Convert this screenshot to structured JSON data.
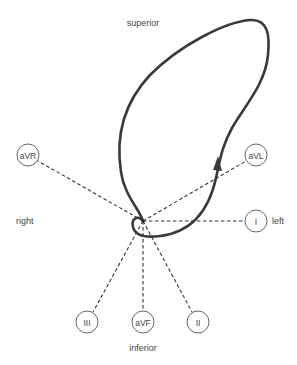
{
  "diagram": {
    "type": "hexaxial vectorcardiogram loop",
    "directions": {
      "superior": "superior",
      "inferior": "inferior",
      "right": "right",
      "left": "left"
    },
    "center": {
      "x": 143,
      "y": 221
    },
    "leads": [
      {
        "id": "aVR",
        "label": "aVR",
        "x": 28,
        "y": 155
      },
      {
        "id": "aVL",
        "label": "aVL",
        "x": 256,
        "y": 155
      },
      {
        "id": "I",
        "label": "I",
        "x": 256,
        "y": 221
      },
      {
        "id": "III",
        "label": "III",
        "x": 87,
        "y": 322
      },
      {
        "id": "aVF",
        "label": "aVF",
        "x": 143,
        "y": 322
      },
      {
        "id": "II",
        "label": "II",
        "x": 198,
        "y": 322
      }
    ],
    "colors": {
      "loop": "#3a3a3a",
      "lines": "#333333",
      "text": "#444444",
      "background": "#ffffff"
    }
  }
}
